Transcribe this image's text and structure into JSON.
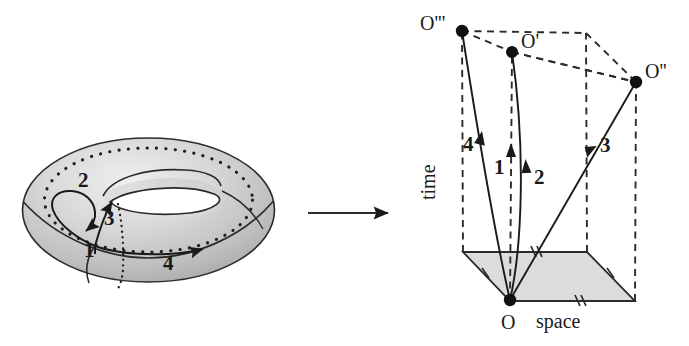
{
  "figure": {
    "transform_arrow": "transform-arrow"
  },
  "colors": {
    "stroke": "#1a1a1a",
    "torus_fill_light": "#e2e2e2",
    "torus_fill_mid": "#c9c9c9",
    "torus_fill_dark": "#a8a8a8",
    "plane_fill": "#d9d9d9",
    "background": "#ffffff"
  },
  "torus": {
    "name": "torus-diagram",
    "loop_labels": [
      {
        "id": "loop-1",
        "text": "1",
        "x": 84,
        "y": 247
      },
      {
        "id": "loop-2",
        "text": "2",
        "x": 85,
        "y": 183
      },
      {
        "id": "loop-3",
        "text": "3",
        "x": 104,
        "y": 216
      },
      {
        "id": "loop-4",
        "text": "4",
        "x": 163,
        "y": 253
      }
    ]
  },
  "spacetime": {
    "name": "spacetime-diagram",
    "axis_labels": {
      "time": "time",
      "space": "space"
    },
    "vertices": [
      {
        "id": "vertex-O",
        "label": "O",
        "x": 510,
        "y": 300
      },
      {
        "id": "vertex-Op",
        "label": "O'",
        "x": 512,
        "y": 52
      },
      {
        "id": "vertex-Opp",
        "label": "O''",
        "x": 636,
        "y": 82
      },
      {
        "id": "vertex-Oppp",
        "label": "O'''",
        "x": 462,
        "y": 31
      }
    ],
    "vertex_label_pos": [
      {
        "id": "label-Oppp",
        "text": "O'''",
        "x": 424,
        "y": 15
      },
      {
        "id": "label-Op",
        "text": "O'",
        "x": 521,
        "y": 33
      },
      {
        "id": "label-Opp",
        "text": "O''",
        "x": 645,
        "y": 63
      },
      {
        "id": "label-O",
        "text": "O",
        "x": 503,
        "y": 313
      }
    ],
    "worldline_labels": [
      {
        "id": "worldline-4",
        "text": "4",
        "x": 466,
        "y": 140
      },
      {
        "id": "worldline-1",
        "text": "1",
        "x": 496,
        "y": 162
      },
      {
        "id": "worldline-2",
        "text": "2",
        "x": 536,
        "y": 172
      },
      {
        "id": "worldline-3",
        "text": "3",
        "x": 601,
        "y": 141
      }
    ],
    "axis_label_pos": {
      "time": {
        "x": 438,
        "y": 178
      },
      "space": {
        "x": 536,
        "y": 313
      }
    }
  }
}
